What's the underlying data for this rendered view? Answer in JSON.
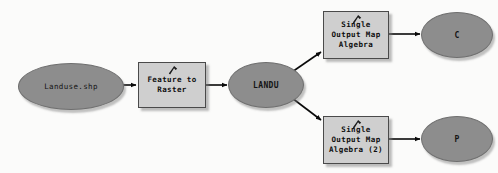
{
  "diagram": {
    "background_color": "#fbfbfa",
    "data_node_color": "#8d8d8d",
    "process_node_color": "#cfcfcf",
    "connector_color": "#0a0a0a",
    "nodes": [
      {
        "id": "landuse_shp",
        "kind": "data",
        "label": "Landuse.shp",
        "x": 18,
        "y": 63,
        "w": 104,
        "h": 45
      },
      {
        "id": "feature_to_raster",
        "kind": "process",
        "label": "Feature to\nRaster",
        "icon": "hammer-icon",
        "x": 138,
        "y": 62,
        "w": 66,
        "h": 44
      },
      {
        "id": "landu",
        "kind": "data",
        "label": "LANDU",
        "x": 228,
        "y": 62,
        "w": 74,
        "h": 44
      },
      {
        "id": "soma_1",
        "kind": "process",
        "label": "Single\nOutput Map\nAlgebra",
        "icon": "hammer-icon",
        "x": 323,
        "y": 11,
        "w": 64,
        "h": 46
      },
      {
        "id": "soma_2",
        "kind": "process",
        "label": "Single\nOutput Map\nAlgebra (2)",
        "icon": "hammer-icon",
        "x": 323,
        "y": 116,
        "w": 64,
        "h": 46
      },
      {
        "id": "out_c",
        "kind": "data",
        "label": "C",
        "x": 421,
        "y": 12,
        "w": 70,
        "h": 44
      },
      {
        "id": "out_p",
        "kind": "data",
        "label": "P",
        "x": 421,
        "y": 116,
        "w": 70,
        "h": 44
      }
    ],
    "connectors": [
      {
        "id": "e1",
        "from": "landuse_shp",
        "to": "feature_to_raster"
      },
      {
        "id": "e2",
        "from": "feature_to_raster",
        "to": "landu"
      },
      {
        "id": "e3",
        "from": "landu",
        "to": "soma_1"
      },
      {
        "id": "e4",
        "from": "landu",
        "to": "soma_2"
      },
      {
        "id": "e5",
        "from": "soma_1",
        "to": "out_c"
      },
      {
        "id": "e6",
        "from": "soma_2",
        "to": "out_p"
      }
    ]
  }
}
